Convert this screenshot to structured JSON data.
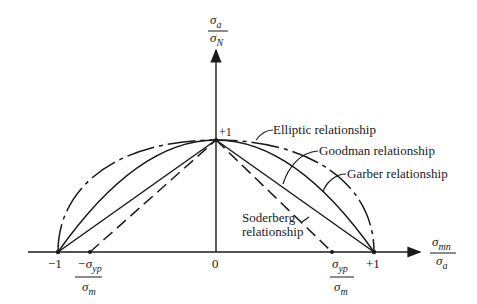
{
  "diagram": {
    "y_axis": {
      "label_num": "σ",
      "label_num_sub": "a",
      "label_den": "σ",
      "label_den_sub": "N",
      "tick_plus1": "+1"
    },
    "x_axis": {
      "label_num": "σ",
      "label_num_sub": "mn",
      "label_den": "σ",
      "label_den_sub": "a",
      "tick_minus1": "−1",
      "tick_zero": "0",
      "tick_plus1": "+1",
      "neg_yield_num": "−σ",
      "neg_yield_num_sub": "yp",
      "neg_yield_den": "σ",
      "neg_yield_den_sub": "m",
      "pos_yield_num": "σ",
      "pos_yield_num_sub": "yp",
      "pos_yield_den": "σ",
      "pos_yield_den_sub": "m"
    },
    "curves": [
      {
        "name": "Elliptic relationship",
        "style": "dash-dot"
      },
      {
        "name": "Goodman relationship",
        "style": "solid-straight"
      },
      {
        "name": "Garber relationship",
        "style": "solid-curved"
      },
      {
        "name": "Soderberg",
        "name2": "relationship",
        "style": "dashed-straight"
      }
    ]
  }
}
